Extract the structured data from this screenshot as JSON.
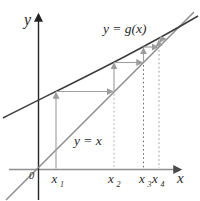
{
  "figure_labels": {
    "y_axis": "y",
    "x_axis": "x",
    "origin": "0",
    "curve": "y = g(x)",
    "identity_line": "y = x"
  },
  "tick_labels": [
    {
      "base": "x",
      "sub": "1"
    },
    {
      "base": "x",
      "sub": "2"
    },
    {
      "base": "x",
      "sub": "3"
    },
    {
      "base": "x",
      "sub": "4"
    }
  ],
  "colors": {
    "background": "#ffffff",
    "curve": "#3d3d3d",
    "identity_line": "#8a8a8a",
    "x_axis": "#8f8f8f",
    "y_axis": "#242424",
    "cobweb_arrows": "#a0a0a0",
    "dotted_guides": "#9a9a9a",
    "text": "#2a2a2a"
  }
}
